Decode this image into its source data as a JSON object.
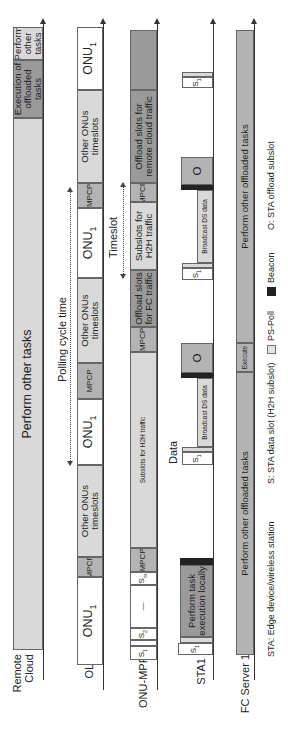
{
  "rows": {
    "remote_cloud": {
      "label": "Remote\nCloud",
      "segments": [
        {
          "text": "Perform other tasks",
          "y": [
            27,
            60
          ]
        },
        {
          "text": "Execution of offloaded tasks",
          "y": [
            60,
            118
          ]
        },
        {
          "text": "Perform other tasks",
          "y": [
            118,
            650
          ]
        }
      ]
    },
    "olt": {
      "label": "OLT",
      "segments": [
        "ONU1",
        "Other ONUs timeslots",
        "MPCP",
        "ONU1",
        "Other ONUs timeslots",
        "MPCP",
        "ONU1",
        "Other ONUs timeslots",
        "MPCP",
        "ONU1"
      ]
    },
    "onu_mpp": {
      "label": "ONU-MPP",
      "segments": [
        "Offload slots for remote cloud traffic",
        "MPCP",
        "Subslots for H2H traffic",
        "Offload slots for FC traffic",
        "MPCP",
        "Subslots for H2H traffic",
        "MPCP",
        "Sm",
        "—",
        "S2",
        "S1"
      ]
    },
    "sta1": {
      "label": "STA1",
      "segments": {
        "offload_1": "O",
        "offload_2": "O",
        "broadcast_1": "Broadcast DS data",
        "broadcast_2": "Broadcast DS data",
        "s1": "S1",
        "local": "Perform task execution locally"
      }
    },
    "fc_server": {
      "label": "FC Server 1",
      "segments": [
        "Perform other offloaded tasks",
        "Execute",
        "Perform other offloaded tasks"
      ]
    }
  },
  "annotations": {
    "polling_cycle": "Polling cycle time",
    "timeslot": "Timeslot",
    "data": "Data"
  },
  "legend": {
    "sta": "STA: Edge device/wireless station",
    "s": "S: STA data slot (H2H subslot)",
    "ps_poll": "PS-Poll",
    "beacon": "Beacon",
    "o": "O: STA offload subslot"
  },
  "colors": {
    "light": "#d9d9d9",
    "mid": "#b3b3b3",
    "dark": "#9a9a9a",
    "beacon": "#222222"
  }
}
